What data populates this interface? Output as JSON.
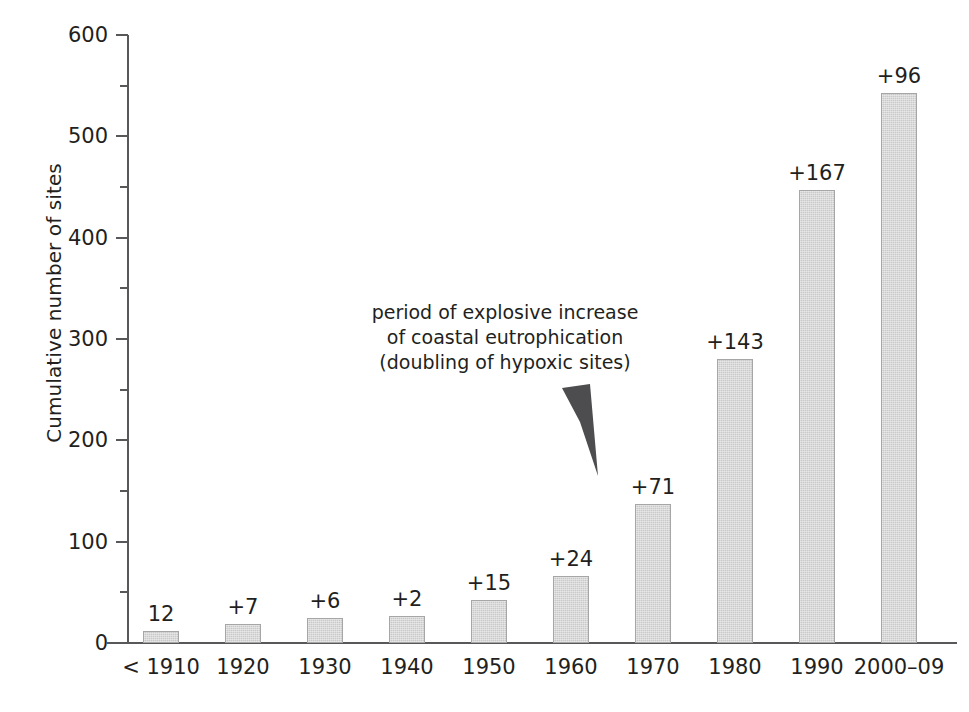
{
  "chart_data": {
    "type": "bar",
    "title": "",
    "xlabel": "",
    "ylabel": "Cumulative number of sites",
    "ylim": [
      0,
      600
    ],
    "ytick_major": [
      0,
      100,
      200,
      300,
      400,
      500,
      600
    ],
    "ytick_minor": [
      50,
      150,
      250,
      350,
      450,
      550
    ],
    "grid": false,
    "legend": null,
    "categories": [
      "< 1910",
      "1920",
      "1930",
      "1940",
      "1950",
      "1960",
      "1970",
      "1980",
      "1990",
      "2000–09"
    ],
    "values": [
      12,
      19,
      25,
      27,
      42,
      66,
      137,
      280,
      447,
      543
    ],
    "increments": [
      12,
      7,
      6,
      2,
      15,
      24,
      71,
      143,
      167,
      96
    ],
    "bar_labels": [
      "12",
      "+7",
      "+6",
      "+2",
      "+15",
      "+24",
      "+71",
      "+143",
      "+167",
      "+96"
    ],
    "annotations": [
      {
        "id": "explosive-increase",
        "lines": [
          "period of explosive increase",
          "of coastal eutrophication",
          "(doubling of hypoxic sites)"
        ],
        "arrow": "down-right-wedge"
      }
    ],
    "colors": {
      "bar_fill": "#c9c9c9",
      "bar_stroke": "#a6a6a6",
      "axis": "#58585a",
      "text": "#231f20",
      "arrow": "#4d4d4f",
      "background": "#ffffff"
    }
  },
  "axis": {
    "y_title": "Cumulative number of sites",
    "y_ticks": [
      "600",
      "500",
      "400",
      "300",
      "200",
      "100",
      "0"
    ]
  }
}
